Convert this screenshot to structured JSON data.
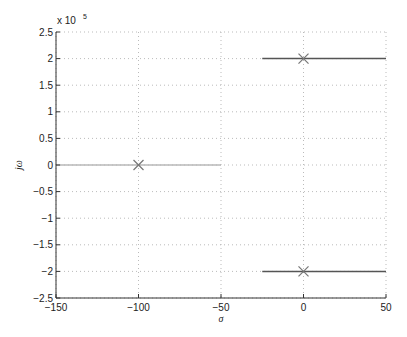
{
  "chart_data": {
    "type": "scatter",
    "title": "",
    "xlabel": "σ",
    "ylabel": "jω",
    "xlim": [
      -150,
      50
    ],
    "ylim": [
      -2.5,
      2.5
    ],
    "y_exponent_label": "x 10",
    "y_exponent": "5",
    "y_scale": 100000,
    "grid": true,
    "xticks": [
      -150,
      -100,
      -50,
      0,
      50
    ],
    "xtick_labels": [
      "−150",
      "−100",
      "−50",
      "0",
      "50"
    ],
    "yticks": [
      2.5,
      2,
      1.5,
      1,
      0.5,
      0,
      -0.5,
      -1,
      -1.5,
      -2,
      -2.5
    ],
    "ytick_labels": [
      "2.5",
      "2",
      "1.5",
      "1",
      "0.5",
      "0",
      "−0.5",
      "−1",
      "−1.5",
      "−2",
      "−2.5"
    ],
    "poles": [
      {
        "sigma": -100,
        "omega": 0
      },
      {
        "sigma": 0,
        "omega": 200000
      },
      {
        "sigma": 0,
        "omega": -200000
      }
    ],
    "series": [
      {
        "name": "real-axis locus",
        "color": "#b8b8b8",
        "x": [
          -150,
          -50
        ],
        "y": [
          0,
          0
        ]
      },
      {
        "name": "upper branch",
        "color": "#555555",
        "x": [
          -25,
          50
        ],
        "y": [
          200000,
          200000
        ]
      },
      {
        "name": "lower branch",
        "color": "#555555",
        "x": [
          -25,
          50
        ],
        "y": [
          -200000,
          -200000
        ]
      }
    ]
  }
}
